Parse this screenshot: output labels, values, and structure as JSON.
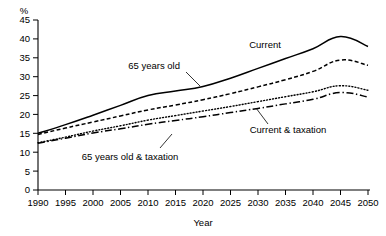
{
  "chart_data": {
    "type": "line",
    "title": "",
    "xlabel": "Year",
    "ylabel": "",
    "unit_label": "%",
    "xlim": [
      1990,
      2050
    ],
    "ylim": [
      0,
      45
    ],
    "grid": false,
    "legend_position": "inline-annotations",
    "x": [
      1990,
      1995,
      2000,
      2005,
      2010,
      2015,
      2020,
      2025,
      2030,
      2035,
      2040,
      2045,
      2050
    ],
    "xticks": [
      "1990",
      "1995",
      "2000",
      "2005",
      "2010",
      "2015",
      "2020",
      "2025",
      "2030",
      "2035",
      "2040",
      "2045",
      "2050"
    ],
    "yticks": [
      "0",
      "5",
      "10",
      "15",
      "20",
      "25",
      "30",
      "35",
      "40",
      "45"
    ],
    "series": [
      {
        "name": "Current",
        "style": "solid",
        "values": [
          15.0,
          17.3,
          19.8,
          22.4,
          25.0,
          26.2,
          27.4,
          29.6,
          32.2,
          34.8,
          37.4,
          40.6,
          38.0
        ]
      },
      {
        "name": "65 years old",
        "style": "dashed",
        "values": [
          14.7,
          16.4,
          18.0,
          19.6,
          21.2,
          22.5,
          23.9,
          25.5,
          27.3,
          29.2,
          31.4,
          34.4,
          33.0
        ]
      },
      {
        "name": "Current & taxation",
        "style": "dotted",
        "values": [
          12.5,
          14.0,
          15.6,
          17.0,
          18.5,
          19.7,
          20.9,
          22.1,
          23.4,
          24.7,
          26.0,
          27.6,
          26.4
        ]
      },
      {
        "name": "65 years old & taxation",
        "style": "dash-dot",
        "values": [
          12.4,
          13.7,
          15.1,
          16.2,
          17.4,
          18.4,
          19.4,
          20.5,
          21.6,
          22.8,
          24.0,
          25.8,
          24.6
        ]
      }
    ],
    "annotations": [
      {
        "label": "Current",
        "x": 265,
        "y": 48
      },
      {
        "label": "65 years old",
        "x": 138,
        "y": 69
      },
      {
        "label": "Current & taxation",
        "x": 260,
        "y": 130
      },
      {
        "label": "65 years old & taxation",
        "x": 63,
        "y": 156
      }
    ]
  },
  "colors": {
    "axis": "#000000",
    "line": "#000000",
    "background": "#ffffff"
  }
}
